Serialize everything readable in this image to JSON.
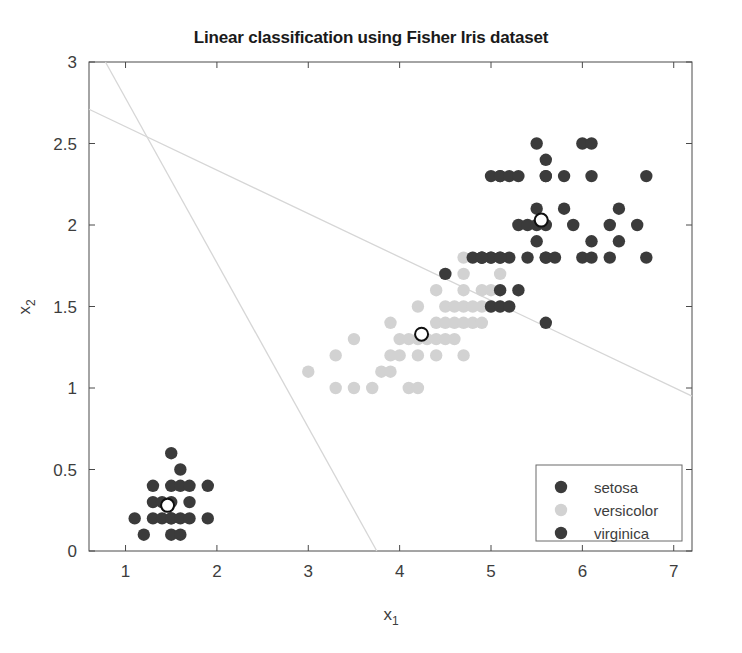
{
  "chart_data": {
    "type": "scatter",
    "title": "Linear classification using Fisher Iris dataset",
    "xlabel": "x_1",
    "xlabel_base": "x",
    "xlabel_sub": "1",
    "ylabel": "x_2",
    "ylabel_base": "x",
    "ylabel_sub": "2",
    "xlim": [
      0.6,
      7.2
    ],
    "ylim": [
      0,
      3
    ],
    "xticks": [
      1,
      2,
      3,
      4,
      5,
      6,
      7
    ],
    "xtick_labels": [
      "1",
      "2",
      "3",
      "4",
      "5",
      "6",
      "7"
    ],
    "yticks": [
      0,
      0.5,
      1,
      1.5,
      2,
      2.5,
      3
    ],
    "ytick_labels": [
      "0",
      "0.5",
      "1",
      "1.5",
      "2",
      "2.5",
      "3"
    ],
    "grid": false,
    "legend_position": "lower right",
    "legend_entries": [
      {
        "label": "setosa",
        "color": "#3b3b3b"
      },
      {
        "label": "versicolor",
        "color": "#d2d2d2"
      },
      {
        "label": "virginica",
        "color": "#3b3b3b"
      }
    ],
    "series": [
      {
        "name": "setosa",
        "color": "#3b3b3b",
        "marker": "circle",
        "points": [
          [
            1.5,
            0.6
          ],
          [
            1.6,
            0.5
          ],
          [
            1.3,
            0.4
          ],
          [
            1.5,
            0.4
          ],
          [
            1.6,
            0.4
          ],
          [
            1.7,
            0.4
          ],
          [
            1.9,
            0.4
          ],
          [
            1.3,
            0.3
          ],
          [
            1.4,
            0.3
          ],
          [
            1.5,
            0.3
          ],
          [
            1.7,
            0.3
          ],
          [
            1.1,
            0.2
          ],
          [
            1.3,
            0.2
          ],
          [
            1.4,
            0.2
          ],
          [
            1.5,
            0.2
          ],
          [
            1.5,
            0.2
          ],
          [
            1.6,
            0.2
          ],
          [
            1.7,
            0.2
          ],
          [
            1.9,
            0.2
          ],
          [
            1.2,
            0.1
          ],
          [
            1.5,
            0.1
          ],
          [
            1.6,
            0.1
          ]
        ]
      },
      {
        "name": "versicolor",
        "color": "#d2d2d2",
        "marker": "circle",
        "points": [
          [
            4.7,
            1.8
          ],
          [
            4.8,
            1.8
          ],
          [
            4.5,
            1.7
          ],
          [
            4.7,
            1.7
          ],
          [
            5.1,
            1.7
          ],
          [
            4.4,
            1.6
          ],
          [
            4.7,
            1.6
          ],
          [
            4.9,
            1.6
          ],
          [
            5.0,
            1.6
          ],
          [
            4.2,
            1.5
          ],
          [
            4.5,
            1.5
          ],
          [
            4.6,
            1.5
          ],
          [
            4.7,
            1.5
          ],
          [
            4.8,
            1.5
          ],
          [
            4.9,
            1.5
          ],
          [
            5.0,
            1.5
          ],
          [
            5.1,
            1.5
          ],
          [
            3.9,
            1.4
          ],
          [
            4.4,
            1.4
          ],
          [
            4.5,
            1.4
          ],
          [
            4.6,
            1.4
          ],
          [
            4.7,
            1.4
          ],
          [
            4.8,
            1.4
          ],
          [
            4.9,
            1.4
          ],
          [
            3.5,
            1.3
          ],
          [
            4.0,
            1.3
          ],
          [
            4.1,
            1.3
          ],
          [
            4.2,
            1.3
          ],
          [
            4.3,
            1.3
          ],
          [
            4.4,
            1.3
          ],
          [
            4.5,
            1.3
          ],
          [
            4.6,
            1.3
          ],
          [
            3.3,
            1.2
          ],
          [
            3.9,
            1.2
          ],
          [
            4.0,
            1.2
          ],
          [
            4.2,
            1.2
          ],
          [
            4.4,
            1.2
          ],
          [
            4.7,
            1.2
          ],
          [
            3.0,
            1.1
          ],
          [
            3.8,
            1.1
          ],
          [
            3.9,
            1.1
          ],
          [
            3.3,
            1.0
          ],
          [
            3.5,
            1.0
          ],
          [
            3.7,
            1.0
          ],
          [
            4.1,
            1.0
          ],
          [
            4.2,
            1.0
          ]
        ]
      },
      {
        "name": "virginica",
        "color": "#3b3b3b",
        "marker": "circle",
        "points": [
          [
            5.6,
            2.4
          ],
          [
            6.0,
            2.5
          ],
          [
            6.1,
            2.5
          ],
          [
            5.5,
            2.5
          ],
          [
            5.1,
            2.3
          ],
          [
            5.6,
            2.3
          ],
          [
            6.7,
            2.3
          ],
          [
            5.0,
            2.3
          ],
          [
            5.1,
            2.3
          ],
          [
            5.2,
            2.3
          ],
          [
            5.3,
            2.3
          ],
          [
            5.6,
            2.3
          ],
          [
            5.8,
            2.3
          ],
          [
            6.1,
            2.3
          ],
          [
            5.5,
            2.1
          ],
          [
            5.8,
            2.1
          ],
          [
            6.4,
            2.1
          ],
          [
            5.3,
            2.0
          ],
          [
            5.4,
            2.0
          ],
          [
            5.5,
            2.0
          ],
          [
            5.6,
            2.0
          ],
          [
            5.9,
            2.0
          ],
          [
            6.3,
            2.0
          ],
          [
            6.6,
            2.0
          ],
          [
            4.9,
            1.8
          ],
          [
            5.0,
            1.8
          ],
          [
            5.1,
            1.8
          ],
          [
            5.2,
            1.8
          ],
          [
            5.5,
            1.9
          ],
          [
            6.1,
            1.9
          ],
          [
            6.4,
            1.9
          ],
          [
            4.9,
            1.8
          ],
          [
            5.0,
            1.8
          ],
          [
            5.6,
            1.8
          ],
          [
            6.0,
            1.8
          ],
          [
            6.3,
            1.8
          ],
          [
            4.8,
            1.8
          ],
          [
            4.9,
            1.8
          ],
          [
            5.1,
            1.8
          ],
          [
            5.4,
            1.8
          ],
          [
            5.6,
            1.8
          ],
          [
            5.7,
            1.8
          ],
          [
            6.1,
            1.8
          ],
          [
            6.7,
            1.8
          ],
          [
            5.1,
            1.6
          ],
          [
            5.3,
            1.6
          ],
          [
            5.6,
            1.4
          ],
          [
            5.0,
            1.5
          ],
          [
            5.1,
            1.5
          ],
          [
            5.2,
            1.5
          ],
          [
            4.5,
            1.7
          ]
        ]
      },
      {
        "name": "centroids",
        "color": "#ffffff",
        "marker": "open-circle",
        "points": [
          [
            1.46,
            0.28
          ],
          [
            4.24,
            1.33
          ],
          [
            5.55,
            2.03
          ]
        ]
      }
    ],
    "decision_boundaries": [
      {
        "name": "boundary-setosa-versicolor",
        "color": "#d6d6d6",
        "x1": 0.78,
        "y1": 3.0,
        "x2": 3.75,
        "y2": 0.0
      },
      {
        "name": "boundary-versicolor-virginica",
        "color": "#d6d6d6",
        "x1": 0.6,
        "y1": 2.71,
        "x2": 7.2,
        "y2": 0.95
      }
    ]
  }
}
